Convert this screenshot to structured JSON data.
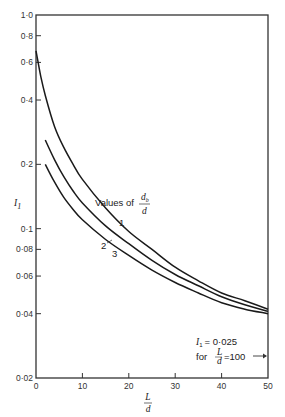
{
  "chart_data": {
    "type": "line",
    "title": "",
    "xlabel": "L/d",
    "ylabel": "I1",
    "x_scale": "linear",
    "y_scale": "log",
    "xlim": [
      0,
      50
    ],
    "ylim": [
      0.02,
      1.0
    ],
    "x_ticks": [
      "0",
      "10",
      "20",
      "30",
      "40",
      "50"
    ],
    "y_ticks": [
      "0·02",
      "0·04",
      "0·06",
      "0·08",
      "0·1",
      "0·2",
      "0·4",
      "0·6",
      "0·8",
      "1·0"
    ],
    "grid": false,
    "legend_title": "Values of d_b/d",
    "series": [
      {
        "name": "1",
        "x": [
          0,
          1,
          2,
          4,
          6,
          8,
          10,
          15,
          20,
          25,
          30,
          35,
          40,
          45,
          50
        ],
        "y": [
          0.68,
          0.52,
          0.42,
          0.3,
          0.24,
          0.2,
          0.17,
          0.125,
          0.097,
          0.08,
          0.066,
          0.057,
          0.05,
          0.046,
          0.042
        ]
      },
      {
        "name": "2",
        "x": [
          2,
          4,
          6,
          8,
          10,
          15,
          20,
          25,
          30,
          35,
          40,
          45,
          50
        ],
        "y": [
          0.26,
          0.21,
          0.175,
          0.15,
          0.132,
          0.103,
          0.085,
          0.071,
          0.061,
          0.054,
          0.048,
          0.044,
          0.041
        ]
      },
      {
        "name": "3",
        "x": [
          2,
          4,
          6,
          8,
          10,
          15,
          20,
          25,
          30,
          35,
          40,
          45,
          50
        ],
        "y": [
          0.2,
          0.165,
          0.14,
          0.123,
          0.11,
          0.089,
          0.075,
          0.064,
          0.056,
          0.05,
          0.045,
          0.042,
          0.04
        ]
      }
    ],
    "annotations": [
      {
        "text": "I1 = 0·025 for L/d = 100",
        "position": "lower right, arrow pointing to right axis"
      }
    ]
  },
  "labels": {
    "ylabel_main": "I",
    "ylabel_sub": "1",
    "xlabel_num": "L",
    "xlabel_den": "d",
    "legend_prefix": "Values of",
    "legend_num": "d",
    "legend_num_sub": "b",
    "legend_den": "d",
    "curve1": "1",
    "curve2": "2",
    "curve3": "3",
    "note_line1_var": "I",
    "note_line1_sub": "1",
    "note_line1_rest": "= 0·025",
    "note_line2_for": "for",
    "note_line2_num": "L",
    "note_line2_den": "d",
    "note_line2_rest": "=100"
  }
}
